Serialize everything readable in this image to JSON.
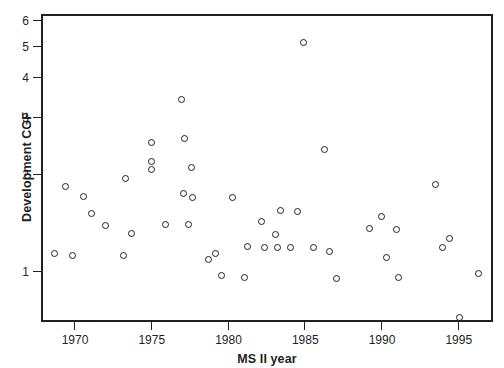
{
  "chart_data": {
    "type": "scatter",
    "title": "",
    "xlabel": "MS II year",
    "ylabel": "Development CGF",
    "xlim": [
      1968.3,
      1996.6
    ],
    "ylim": [
      0.62,
      6.0
    ],
    "yscale": "log",
    "xscale": "linear",
    "grid": false,
    "legend": null,
    "xticks": [
      1970,
      1975,
      1980,
      1985,
      1990,
      1995
    ],
    "xticklabels": [
      "1970",
      "1975",
      "1980",
      "1985",
      "1990",
      "1995"
    ],
    "yticks": [
      1,
      2,
      3,
      4,
      5,
      6
    ],
    "yticklabels": [
      "1",
      "2",
      "3",
      "4",
      "5",
      "6"
    ],
    "marker": "open-circle",
    "marker_color": "#231f20",
    "points": [
      {
        "x": 1968.6,
        "y": 1.15
      },
      {
        "x": 1969.3,
        "y": 1.85
      },
      {
        "x": 1969.8,
        "y": 1.13
      },
      {
        "x": 1970.5,
        "y": 1.73
      },
      {
        "x": 1971.0,
        "y": 1.53
      },
      {
        "x": 1971.9,
        "y": 1.4
      },
      {
        "x": 1973.1,
        "y": 1.13
      },
      {
        "x": 1973.2,
        "y": 1.97
      },
      {
        "x": 1973.6,
        "y": 1.33
      },
      {
        "x": 1974.9,
        "y": 2.55
      },
      {
        "x": 1974.9,
        "y": 2.22
      },
      {
        "x": 1974.9,
        "y": 2.1
      },
      {
        "x": 1975.8,
        "y": 1.41
      },
      {
        "x": 1976.9,
        "y": 3.45
      },
      {
        "x": 1977.1,
        "y": 2.62
      },
      {
        "x": 1977.5,
        "y": 2.13
      },
      {
        "x": 1977.0,
        "y": 1.76
      },
      {
        "x": 1977.6,
        "y": 1.72
      },
      {
        "x": 1977.3,
        "y": 1.41
      },
      {
        "x": 1978.6,
        "y": 1.1
      },
      {
        "x": 1979.1,
        "y": 1.15
      },
      {
        "x": 1979.5,
        "y": 0.98
      },
      {
        "x": 1980.2,
        "y": 1.72
      },
      {
        "x": 1981.0,
        "y": 0.97
      },
      {
        "x": 1981.2,
        "y": 1.21
      },
      {
        "x": 1982.1,
        "y": 1.45
      },
      {
        "x": 1982.3,
        "y": 1.2
      },
      {
        "x": 1983.3,
        "y": 1.56
      },
      {
        "x": 1983.0,
        "y": 1.32
      },
      {
        "x": 1983.1,
        "y": 1.2
      },
      {
        "x": 1984.0,
        "y": 1.2
      },
      {
        "x": 1984.4,
        "y": 1.55
      },
      {
        "x": 1984.8,
        "y": 5.2
      },
      {
        "x": 1985.5,
        "y": 1.2
      },
      {
        "x": 1986.2,
        "y": 2.42
      },
      {
        "x": 1986.5,
        "y": 1.17
      },
      {
        "x": 1987.0,
        "y": 0.96
      },
      {
        "x": 1989.1,
        "y": 1.37
      },
      {
        "x": 1989.9,
        "y": 1.5
      },
      {
        "x": 1990.2,
        "y": 1.12
      },
      {
        "x": 1990.9,
        "y": 1.36
      },
      {
        "x": 1991.0,
        "y": 0.97
      },
      {
        "x": 1993.4,
        "y": 1.88
      },
      {
        "x": 1993.9,
        "y": 1.2
      },
      {
        "x": 1994.3,
        "y": 1.28
      },
      {
        "x": 1995.0,
        "y": 0.73
      },
      {
        "x": 1996.2,
        "y": 1.0
      }
    ]
  }
}
